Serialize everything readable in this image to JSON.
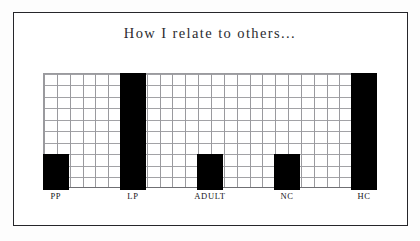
{
  "figure": {
    "title": "How I relate to others...",
    "frame_color": "#26262a",
    "background_color": "#ffffff",
    "bar_color": "#000000",
    "grid_color": "#9a9a9e"
  },
  "chart_data": {
    "type": "bar",
    "title": "How I relate to others...",
    "xlabel": "",
    "ylabel": "",
    "categories": [
      "PP",
      "LP",
      "ADULT",
      "NC",
      "HC"
    ],
    "values": [
      3,
      10,
      3,
      3,
      10
    ],
    "ylim": [
      0,
      10
    ],
    "grid": true,
    "grid_rows": 10,
    "grid_columns": 26,
    "legend": "none",
    "bars": [
      {
        "label": "PP",
        "value": 3,
        "column_start": 1,
        "column_span": 2
      },
      {
        "label": "LP",
        "value": 10,
        "column_start": 7,
        "column_span": 2
      },
      {
        "label": "ADULT",
        "value": 3,
        "column_start": 13,
        "column_span": 2
      },
      {
        "label": "NC",
        "value": 3,
        "column_start": 19,
        "column_span": 2
      },
      {
        "label": "HC",
        "value": 10,
        "column_start": 25,
        "column_span": 2
      }
    ]
  }
}
